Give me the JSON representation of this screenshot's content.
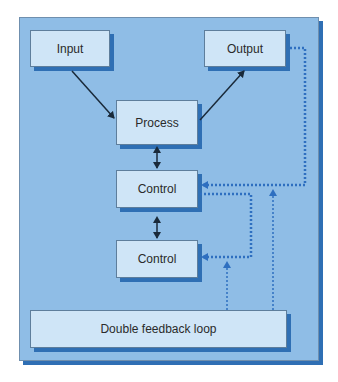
{
  "diagram": {
    "nodes": {
      "input": {
        "label": "Input"
      },
      "output": {
        "label": "Output"
      },
      "process": {
        "label": "Process"
      },
      "control1": {
        "label": "Control"
      },
      "control2": {
        "label": "Control"
      },
      "feedback": {
        "label": "Double feedback loop"
      }
    },
    "edges": [
      {
        "from": "input",
        "to": "process",
        "style": "solid",
        "arrow": "end"
      },
      {
        "from": "process",
        "to": "output",
        "style": "solid",
        "arrow": "end"
      },
      {
        "from": "process",
        "to": "control1",
        "style": "solid",
        "arrow": "both"
      },
      {
        "from": "control1",
        "to": "control2",
        "style": "solid",
        "arrow": "both"
      },
      {
        "from": "output",
        "to": "control1",
        "style": "dotted",
        "arrow": "end"
      },
      {
        "from": "control1",
        "to": "control2",
        "style": "dotted",
        "arrow": "end",
        "route": "right loop"
      },
      {
        "from": "feedback",
        "to": "control2",
        "style": "dotted",
        "arrow": "end"
      },
      {
        "from": "feedback",
        "to": "control1",
        "style": "dotted",
        "arrow": "end"
      }
    ],
    "colors": {
      "panel": "#8fbde6",
      "shadow": "#2f6fb4",
      "box": "#cfe5f7",
      "dotted_line": "#2e6fc0",
      "solid_line": "#1a2a3a"
    }
  }
}
